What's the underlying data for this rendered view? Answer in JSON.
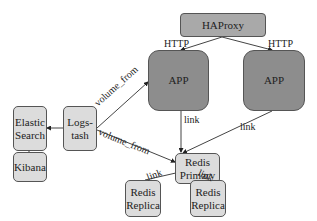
{
  "diagram": {
    "nodes": {
      "haproxy": "HAProxy",
      "app1": "APP",
      "app2": "APP",
      "logstash_l1": "Logs-",
      "logstash_l2": "tash",
      "elastic_l1": "Elastic",
      "elastic_l2": "Search",
      "kibana": "Kibana",
      "redis_primary_l1": "Redis",
      "redis_primary_l2": "Primary",
      "redis_replica1_l1": "Redis",
      "redis_replica1_l2": "Replica",
      "redis_replica2_l1": "Redis",
      "redis_replica2_l2": "Replica"
    },
    "edges": {
      "haproxy_app1": "HTTP",
      "haproxy_app2": "HTTP",
      "logstash_app1": "volume_from",
      "logstash_redis": "volume_from",
      "app1_redis": "link",
      "app2_redis": "link",
      "replica1_redis": "link",
      "replica2_redis": "link"
    },
    "colors": {
      "app_fill": "#8d8d8d",
      "haproxy_fill": "#a9a9a9",
      "light_fill": "#dcdcdc",
      "stroke": "#555555"
    }
  }
}
